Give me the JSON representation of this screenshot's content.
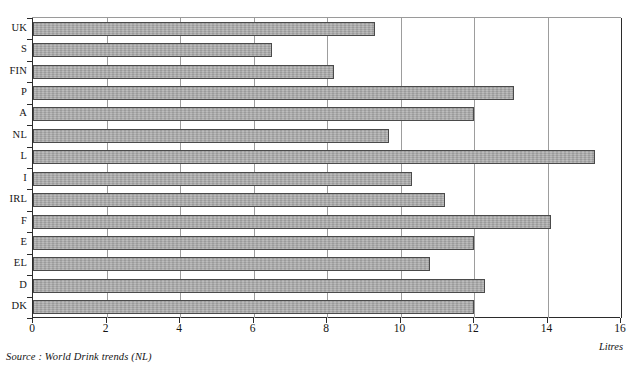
{
  "page": {
    "top_cropped_text": "·  ·   ·    ·     ·      ·       ·        ·         ·          ·           ·",
    "source_note": "Source : World Drink trends (NL)",
    "unit_label": "Litres"
  },
  "colors": {
    "bar_fill": "#a9a9a9",
    "bar_border": "#4a4a4a",
    "axis": "#2b2b2b",
    "gridline": "#9d9d9d",
    "background": "#ffffff",
    "text": "#141414"
  },
  "chart_data": {
    "type": "bar",
    "orientation": "horizontal",
    "title": "",
    "xlabel": "Litres",
    "ylabel": "",
    "xlim": [
      0,
      16
    ],
    "xticks": [
      0,
      2,
      4,
      6,
      8,
      10,
      12,
      14,
      16
    ],
    "xtick_labels": [
      "0",
      "2",
      "4",
      "6",
      "8",
      "10",
      "12",
      "14",
      "16"
    ],
    "grid": "vertical",
    "legend": "none",
    "categories": [
      "UK",
      "S",
      "FIN",
      "P",
      "A",
      "NL",
      "L",
      "I",
      "IRL",
      "F",
      "E",
      "EL",
      "D",
      "DK"
    ],
    "values": [
      9.3,
      6.5,
      8.2,
      13.1,
      12.0,
      9.7,
      15.3,
      10.3,
      11.2,
      14.1,
      12.0,
      10.8,
      12.3,
      12.0
    ],
    "series": [
      {
        "name": "Alcohol consumption",
        "values": [
          9.3,
          6.5,
          8.2,
          13.1,
          12.0,
          9.7,
          15.3,
          10.3,
          11.2,
          14.1,
          12.0,
          10.8,
          12.3,
          12.0
        ]
      }
    ],
    "annotations": [
      "Source : World Drink trends (NL)"
    ]
  }
}
